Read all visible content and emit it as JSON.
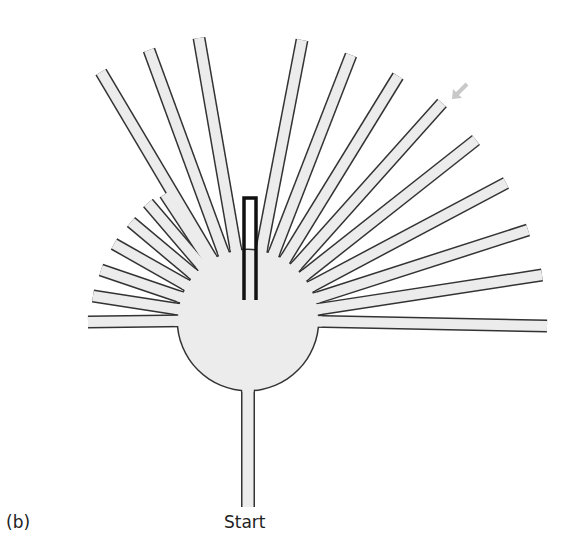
{
  "figure": {
    "panel_label": "(b)",
    "start_label": "Start"
  },
  "colors": {
    "arm_fill": "#ececec",
    "outline": "#333333",
    "marker": "#111111",
    "arrow": "#c8c8c8",
    "background": "#ffffff"
  },
  "hub": {
    "cx": 248,
    "cy": 320,
    "r": 70
  },
  "arm_width": 10,
  "arms": [
    {
      "tip": [
        88,
        322
      ]
    },
    {
      "tip": [
        93,
        296
      ]
    },
    {
      "tip": [
        101,
        270
      ]
    },
    {
      "tip": [
        114,
        244
      ]
    },
    {
      "tip": [
        131,
        222
      ]
    },
    {
      "tip": [
        148,
        203
      ]
    },
    {
      "tip": [
        165,
        194
      ]
    },
    {
      "tip": [
        101,
        72
      ]
    },
    {
      "tip": [
        149,
        50
      ]
    },
    {
      "tip": [
        199,
        38
      ]
    },
    {
      "tip": [
        302,
        40
      ]
    },
    {
      "tip": [
        351,
        55
      ]
    },
    {
      "tip": [
        398,
        76
      ]
    },
    {
      "tip": [
        442,
        103
      ]
    },
    {
      "tip": [
        476,
        140
      ]
    },
    {
      "tip": [
        506,
        183
      ]
    },
    {
      "tip": [
        528,
        230
      ]
    },
    {
      "tip": [
        542,
        275
      ]
    },
    {
      "tip": [
        547,
        326
      ]
    }
  ],
  "stem": {
    "x": 248,
    "y1": 388,
    "y2": 507,
    "width": 11
  },
  "marker": {
    "x1": 244,
    "x2": 256,
    "top": 198,
    "bottom": 300
  },
  "arrow": {
    "from": [
      467,
      84
    ],
    "to": [
      452,
      99
    ]
  }
}
